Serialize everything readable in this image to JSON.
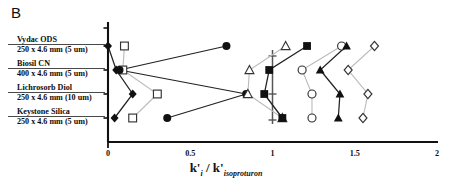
{
  "panel": {
    "letter": "B"
  },
  "axes": {
    "x_label_parts": {
      "k1": "k'",
      "i": "i",
      "slash": "/",
      "k2": "k'",
      "iso": "isoproturon"
    },
    "x_label_text": "k'i / k'isoproturon",
    "x_ticks": [
      "0",
      "0.5",
      "1",
      "1.5",
      "2"
    ],
    "x_min": 0,
    "x_max": 2,
    "x_minor_step": 0.1,
    "y_categories": [
      {
        "name": "Vydac ODS",
        "dims": "250 x 4.6 mm (5 um)"
      },
      {
        "name": "Biosil CN",
        "dims": "400 x 4.6 mm (5 um)"
      },
      {
        "name": "Lichrosorb Diol",
        "dims": "250 x 4.6 mm (10 um)"
      },
      {
        "name": "Keystone Silica",
        "dims": "250 x 4.6 mm (5 um)"
      }
    ]
  },
  "colors": {
    "axis": "#111111",
    "marker_filled": "#111111",
    "marker_open_edge": "#333333",
    "marker_open_fill": "#ffffff",
    "line_dark": "#222222",
    "line_light": "#bcbcbc"
  },
  "chart_data": {
    "type": "scatter",
    "title": "",
    "subtitle": "",
    "xlabel": "k'i / k'isoproturon",
    "ylabel": "",
    "xlim": [
      0,
      2
    ],
    "grid": false,
    "legend": "none",
    "categories": [
      "Vydac ODS 250 x 4.6 mm (5 um)",
      "Biosil CN 400 x 4.6 mm (5 um)",
      "Lichrosorb Diol 250 x 4.6 mm (10 um)",
      "Keystone Silica 250 x 4.6 mm (5 um)"
    ],
    "series": [
      {
        "name": "series-1",
        "marker": "filled-diamond",
        "line": "dark",
        "values": [
          0.0,
          0.05,
          0.15,
          0.04
        ]
      },
      {
        "name": "series-2",
        "marker": "open-square",
        "line": "light",
        "values": [
          0.1,
          0.09,
          0.3,
          0.15
        ]
      },
      {
        "name": "series-3",
        "marker": "filled-circle",
        "line": "dark",
        "values": [
          0.72,
          0.07,
          0.84,
          0.36
        ]
      },
      {
        "name": "series-4",
        "marker": "open-triangle",
        "line": "light",
        "values": [
          1.08,
          0.86,
          0.85,
          1.06
        ]
      },
      {
        "name": "series-5",
        "marker": "filled-square",
        "line": "dark",
        "values": [
          1.21,
          0.98,
          0.95,
          1.06
        ]
      },
      {
        "name": "series-6",
        "marker": "open-circle",
        "line": "light",
        "values": [
          1.42,
          1.18,
          1.24,
          1.24
        ]
      },
      {
        "name": "series-7",
        "marker": "filled-triangle",
        "line": "dark",
        "values": [
          1.45,
          1.29,
          1.41,
          1.4
        ]
      },
      {
        "name": "series-8",
        "marker": "open-diamond",
        "line": "light",
        "values": [
          1.62,
          1.46,
          1.58,
          1.55
        ]
      }
    ]
  }
}
